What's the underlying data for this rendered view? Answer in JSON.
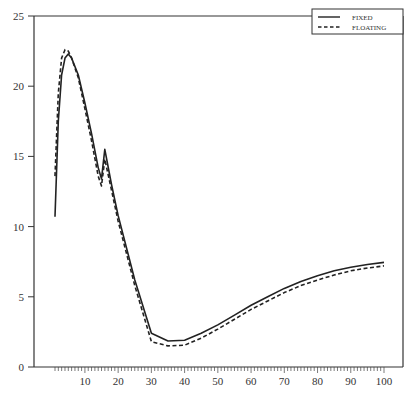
{
  "chart_data": {
    "type": "line",
    "title": "",
    "xlabel": "",
    "ylabel": "",
    "xlim": [
      0,
      105
    ],
    "ylim": [
      0,
      25
    ],
    "grid": false,
    "legend_position": "upper right",
    "x_ticks": [
      10,
      20,
      30,
      40,
      50,
      60,
      70,
      80,
      90,
      100
    ],
    "y_ticks": [
      0,
      5,
      10,
      15,
      20,
      25
    ],
    "x": [
      1,
      2,
      3,
      4,
      5,
      6,
      8,
      10,
      12,
      14,
      15,
      16,
      18,
      20,
      25,
      30,
      35,
      40,
      45,
      50,
      55,
      60,
      65,
      70,
      75,
      80,
      85,
      90,
      95,
      100
    ],
    "series": [
      {
        "name": "FIXED",
        "style": "solid",
        "values": [
          10.7,
          17.5,
          20.8,
          22.0,
          22.3,
          22.0,
          20.8,
          18.8,
          16.6,
          14.2,
          13.4,
          15.5,
          13.0,
          10.8,
          6.2,
          2.4,
          1.85,
          1.9,
          2.4,
          3.0,
          3.7,
          4.4,
          5.0,
          5.6,
          6.1,
          6.5,
          6.85,
          7.1,
          7.3,
          7.45
        ]
      },
      {
        "name": "FLOATING",
        "style": "dashed",
        "values": [
          13.6,
          19.5,
          22.0,
          22.6,
          22.5,
          22.0,
          20.6,
          18.4,
          16.1,
          13.6,
          12.9,
          14.8,
          12.6,
          10.4,
          5.8,
          1.8,
          1.5,
          1.55,
          2.05,
          2.7,
          3.4,
          4.1,
          4.7,
          5.3,
          5.8,
          6.2,
          6.55,
          6.85,
          7.05,
          7.2
        ]
      }
    ]
  },
  "legend": {
    "items": [
      {
        "label": "FIXED",
        "style": "solid"
      },
      {
        "label": "FLOATING",
        "style": "dashed"
      }
    ]
  },
  "axes": {
    "x_tick_labels": [
      "10",
      "20",
      "30",
      "40",
      "50",
      "60",
      "70",
      "80",
      "90",
      "100"
    ],
    "y_tick_labels": [
      "0",
      "5",
      "10",
      "15",
      "20",
      "25"
    ]
  }
}
